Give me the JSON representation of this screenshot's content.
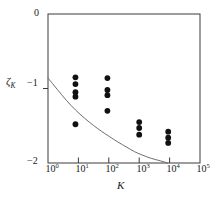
{
  "figure": {
    "background": "#ffffff",
    "frame_color": "#3a3a3a",
    "marker_color": "#111111",
    "curve_color": "#6e6e6e"
  },
  "chart_data": {
    "type": "scatter",
    "title": "",
    "xlabel": "K",
    "ylabel": "ζ",
    "ylabel_sub": "K",
    "xscale": "log",
    "yscale": "linear",
    "xlim": [
      1,
      100000
    ],
    "ylim": [
      -2,
      0
    ],
    "grid": false,
    "legend": null,
    "xticks": [
      1,
      10,
      100,
      1000,
      10000,
      100000
    ],
    "xtick_labels": [
      "10⁰",
      "10¹",
      "10²",
      "10³",
      "10⁴",
      "10⁵"
    ],
    "xtick_mantissa": [
      "10",
      "10",
      "10",
      "10",
      "10",
      "10"
    ],
    "xtick_exponent": [
      "0",
      "1",
      "2",
      "3",
      "4",
      "5"
    ],
    "yticks": [
      0,
      -1,
      -2
    ],
    "ytick_labels": [
      "0",
      "−1",
      "−2"
    ],
    "series": [
      {
        "name": "measured exponents",
        "marker": "filled-circle",
        "points": [
          {
            "x": 8,
            "y": -0.85
          },
          {
            "x": 8,
            "y": -0.94
          },
          {
            "x": 8,
            "y": -1.05
          },
          {
            "x": 8,
            "y": -1.11
          },
          {
            "x": 8,
            "y": -1.48
          },
          {
            "x": 90,
            "y": -0.86
          },
          {
            "x": 90,
            "y": -1.02
          },
          {
            "x": 90,
            "y": -1.09
          },
          {
            "x": 90,
            "y": -1.3
          },
          {
            "x": 1000,
            "y": -1.45
          },
          {
            "x": 1000,
            "y": -1.53
          },
          {
            "x": 1000,
            "y": -1.62
          },
          {
            "x": 9000,
            "y": -1.58
          },
          {
            "x": 9000,
            "y": -1.66
          },
          {
            "x": 9000,
            "y": -1.73
          }
        ]
      }
    ],
    "curve": {
      "name": "theoretical prediction",
      "style": "solid-thin",
      "points": [
        {
          "x": 1,
          "y": -0.86
        },
        {
          "x": 2,
          "y": -1.01
        },
        {
          "x": 4,
          "y": -1.16
        },
        {
          "x": 8,
          "y": -1.29
        },
        {
          "x": 16,
          "y": -1.4
        },
        {
          "x": 32,
          "y": -1.5
        },
        {
          "x": 60,
          "y": -1.58
        },
        {
          "x": 100,
          "y": -1.64
        },
        {
          "x": 200,
          "y": -1.72
        },
        {
          "x": 400,
          "y": -1.79
        },
        {
          "x": 700,
          "y": -1.85
        },
        {
          "x": 1200,
          "y": -1.89
        },
        {
          "x": 2500,
          "y": -1.94
        },
        {
          "x": 5000,
          "y": -1.97
        },
        {
          "x": 8500,
          "y": -2.0
        }
      ]
    }
  }
}
